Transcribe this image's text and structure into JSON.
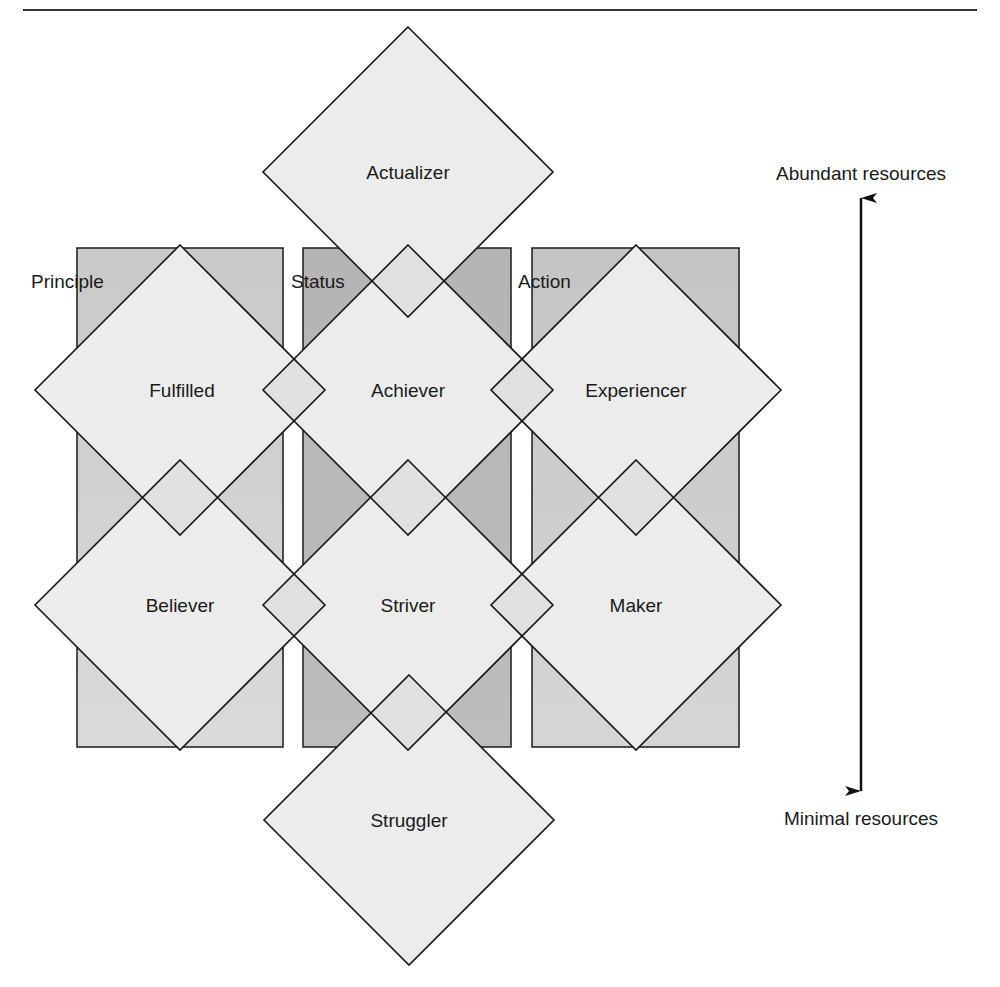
{
  "diagram": {
    "colors": {
      "line": "#1a1a1a",
      "diamond_fill": "#ececec",
      "overlap_fill": "#e2e2e2",
      "principle_rect_top": "#c9c9c9",
      "principle_rect_bottom": "#dadada",
      "status_rect_top": "#b4b4b4",
      "status_rect_bottom": "#bdbdbd",
      "action_rect_top": "#c4c4c4",
      "action_rect_bottom": "#d6d6d6"
    },
    "columns": [
      {
        "id": "principle",
        "label": "Principle",
        "rect": [
          77,
          248,
          206,
          499
        ],
        "label_pos": [
          31,
          281
        ]
      },
      {
        "id": "status",
        "label": "Status",
        "rect": [
          303,
          248,
          208,
          499
        ],
        "label_pos": [
          291,
          281
        ]
      },
      {
        "id": "action",
        "label": "Action",
        "rect": [
          532,
          248,
          207,
          499
        ],
        "label_pos": [
          518,
          281
        ]
      }
    ],
    "segments": [
      {
        "id": "actualizer",
        "label": "Actualizer",
        "center": [
          408,
          172
        ],
        "half": 145
      },
      {
        "id": "fulfilled",
        "label": "Fulfilled",
        "center": [
          180,
          390
        ],
        "half": 145
      },
      {
        "id": "achiever",
        "label": "Achiever",
        "center": [
          408,
          390
        ],
        "half": 145
      },
      {
        "id": "experiencer",
        "label": "Experiencer",
        "center": [
          636,
          390
        ],
        "half": 145
      },
      {
        "id": "believer",
        "label": "Believer",
        "center": [
          180,
          605
        ],
        "half": 145
      },
      {
        "id": "striver",
        "label": "Striver",
        "center": [
          408,
          605
        ],
        "half": 145
      },
      {
        "id": "maker",
        "label": "Maker",
        "center": [
          636,
          605
        ],
        "half": 145
      },
      {
        "id": "struggler",
        "label": "Struggler",
        "center": [
          409,
          820
        ],
        "half": 145
      }
    ],
    "resource_axis": {
      "top_label": "Abundant resources",
      "bottom_label": "Minimal resources",
      "x": 861,
      "y_top": 196,
      "y_bottom": 793
    },
    "header_rule": {
      "x1": 23,
      "x2": 977,
      "y": 10
    }
  }
}
